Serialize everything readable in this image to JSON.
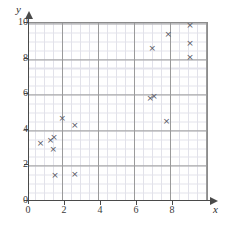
{
  "chart_data": {
    "type": "scatter",
    "title": "",
    "xlabel": "x",
    "ylabel": "y",
    "xlim": [
      0,
      10
    ],
    "ylim": [
      0,
      10
    ],
    "grid": true,
    "legend": null,
    "major_step": 2,
    "minor_step": 0.5,
    "marker": "x",
    "marker_color": "#55555f",
    "grid_major_color": "#9a9a9a",
    "grid_minor_color": "#e2e2ea",
    "axis_color": "#4a4a4a",
    "xticks": [
      0,
      2,
      4,
      6,
      8
    ],
    "xtick_labels": [
      "0",
      "2",
      "4",
      "6",
      "8"
    ],
    "yticks": [
      0,
      2,
      4,
      6,
      8,
      10
    ],
    "ytick_labels": [
      "0",
      "2",
      "4",
      "6",
      "8",
      "10"
    ],
    "points": [
      {
        "x": 0.7,
        "y": 3.2
      },
      {
        "x": 1.25,
        "y": 3.35
      },
      {
        "x": 1.45,
        "y": 3.5
      },
      {
        "x": 1.4,
        "y": 2.85
      },
      {
        "x": 1.5,
        "y": 1.35
      },
      {
        "x": 1.9,
        "y": 4.6
      },
      {
        "x": 2.6,
        "y": 4.2
      },
      {
        "x": 2.6,
        "y": 1.45
      },
      {
        "x": 6.8,
        "y": 5.7
      },
      {
        "x": 7.0,
        "y": 5.8
      },
      {
        "x": 6.9,
        "y": 8.5
      },
      {
        "x": 7.7,
        "y": 4.4
      },
      {
        "x": 7.8,
        "y": 9.3
      },
      {
        "x": 9.0,
        "y": 9.8
      },
      {
        "x": 9.0,
        "y": 8.8
      },
      {
        "x": 9.0,
        "y": 8.0
      }
    ]
  }
}
